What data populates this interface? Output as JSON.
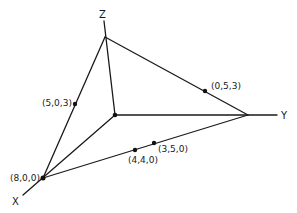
{
  "diagram": {
    "type": "3d-coordinate-tetrahedron",
    "axes": {
      "x": {
        "label": "X"
      },
      "y": {
        "label": "Y"
      },
      "z": {
        "label": "Z"
      }
    },
    "points": [
      {
        "id": "p-8-0-0",
        "label": "(8,0,0)"
      },
      {
        "id": "p-5-0-3",
        "label": "(5,0,3)"
      },
      {
        "id": "p-0-5-3",
        "label": "(0,5,3)"
      },
      {
        "id": "p-4-4-0",
        "label": "(4,4,0)"
      },
      {
        "id": "p-3-5-0",
        "label": "(3,5,0)"
      }
    ],
    "colors": {
      "line": "#1a1a1a",
      "background": "#ffffff"
    }
  }
}
